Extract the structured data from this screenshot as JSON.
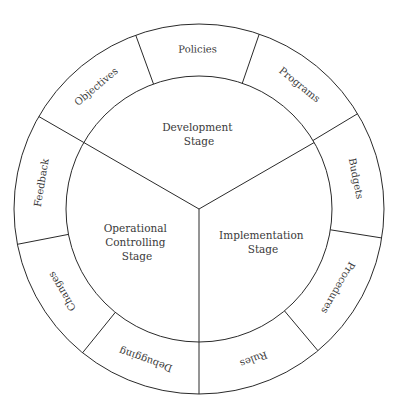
{
  "diagram": {
    "center": [
      199,
      209
    ],
    "outer_radius": 185,
    "inner_radius": 133,
    "stroke_color": "#2a2a2a",
    "text_color": "#3a3a3a",
    "stages": [
      {
        "id": "development",
        "lines": [
          "Development",
          "Stage"
        ],
        "x": 199,
        "y": [
          128,
          142
        ]
      },
      {
        "id": "operational",
        "lines": [
          "Operational",
          "Controlling",
          "Stage"
        ],
        "x": 137,
        "y": [
          229,
          243,
          257
        ]
      },
      {
        "id": "implementation",
        "lines": [
          "Implementation",
          "Stage"
        ],
        "x": 263,
        "y": [
          236,
          250
        ]
      }
    ],
    "stage_divider_angles": [
      -150,
      -30,
      90
    ],
    "segment_divider_angles": [
      -110,
      -71,
      -31,
      9,
      50,
      90,
      129,
      169,
      210
    ],
    "segments": [
      {
        "id": "policies",
        "label": "Policies",
        "stage": "development",
        "mid_angle": -90.5
      },
      {
        "id": "programs",
        "label": "Programs",
        "stage": "development",
        "mid_angle": -51
      },
      {
        "id": "budgets",
        "label": "Budgets",
        "stage": "implementation",
        "mid_angle": -11
      },
      {
        "id": "procedures",
        "label": "Procedures",
        "stage": "implementation",
        "mid_angle": 29.5
      },
      {
        "id": "rules",
        "label": "Rules",
        "stage": "implementation",
        "mid_angle": 70
      },
      {
        "id": "debugging",
        "label": "Debugging",
        "stage": "operational",
        "mid_angle": 109.5
      },
      {
        "id": "changes",
        "label": "Changes",
        "stage": "operational",
        "mid_angle": 149
      },
      {
        "id": "feedback",
        "label": "Feedback",
        "stage": "operational",
        "mid_angle": 189.5
      },
      {
        "id": "objectives",
        "label": "Objectives",
        "stage": "development",
        "mid_angle": 230
      }
    ]
  }
}
